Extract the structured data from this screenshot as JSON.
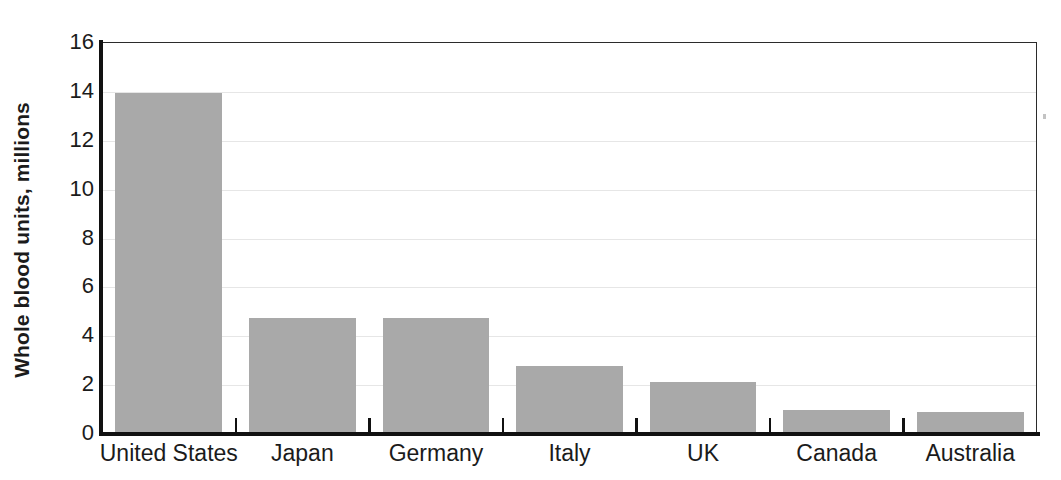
{
  "chart_data": {
    "type": "bar",
    "title": "",
    "subtitle": "",
    "xlabel": "",
    "ylabel": "Whole blood units, millions",
    "categories": [
      "United States",
      "Japan",
      "Germany",
      "Italy",
      "UK",
      "Canada",
      "Australia"
    ],
    "values": [
      13.9,
      4.7,
      4.7,
      2.75,
      2.1,
      0.95,
      0.85
    ],
    "series": [
      {
        "name": "Whole blood units",
        "values": [
          13.9,
          4.7,
          4.7,
          2.75,
          2.1,
          0.95,
          0.85
        ]
      }
    ],
    "ylim": [
      0,
      16
    ],
    "xlim": [
      0,
      7
    ],
    "yticks": [
      0,
      2,
      4,
      6,
      8,
      10,
      12,
      14,
      16
    ],
    "ytick_labels": [
      "0",
      "2",
      "4",
      "6",
      "8",
      "10",
      "12",
      "14",
      "16"
    ],
    "gridlines": [
      2,
      4,
      6,
      8,
      10,
      12,
      14
    ],
    "grid": true,
    "grid_axis": "y",
    "legend": false,
    "legend_position": "none",
    "bar_color": "#a9a9a9",
    "grid_color": "#e6e6e6",
    "axis_color": "#111111",
    "text_color": "#1b1b1b",
    "annotations": []
  },
  "axis": {
    "y_title": "Whole blood units, millions",
    "tick_labels": [
      "16",
      "14",
      "12",
      "10",
      "8",
      "6",
      "4",
      "2",
      "0"
    ]
  }
}
